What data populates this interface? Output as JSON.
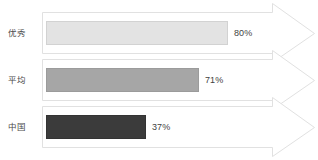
{
  "chart_data": {
    "type": "bar",
    "orientation": "horizontal",
    "title": "",
    "subtitle": "",
    "xlabel": "",
    "ylabel": "",
    "xlim": [
      0,
      100
    ],
    "grid": false,
    "legend": null,
    "units": "%",
    "categories": [
      "优秀",
      "平均",
      "中国"
    ],
    "values": [
      80,
      71,
      37
    ],
    "data_labels": [
      "80%",
      "71%",
      "37%"
    ],
    "bar_colors": [
      "#e3e3e3",
      "#a6a6a6",
      "#3b3b3b"
    ],
    "series": [
      {
        "name": "",
        "points": [
          {
            "category": "优秀",
            "value": 80,
            "label": "80%",
            "color": "#e3e3e3"
          },
          {
            "category": "平均",
            "value": 71,
            "label": "71%",
            "color": "#a6a6a6"
          },
          {
            "category": "中国",
            "value": 37,
            "label": "37%",
            "color": "#3b3b3b"
          }
        ]
      }
    ],
    "annotations": []
  },
  "rows": [
    {
      "label": "优秀",
      "value_label": "80%",
      "bar_width_px": 182,
      "bar_color": "#e3e3e3",
      "bar_border": "#d2d2d2",
      "value_left_px": 188
    },
    {
      "label": "平均",
      "value_label": "71%",
      "bar_width_px": 153,
      "bar_color": "#a6a6a6",
      "bar_border": "#9b9b9b",
      "value_left_px": 159
    },
    {
      "label": "中国",
      "value_label": "37%",
      "bar_width_px": 100,
      "bar_color": "#3b3b3b",
      "bar_border": "#333333",
      "value_left_px": 106
    }
  ],
  "style": {
    "background": "#ffffff",
    "arrow_stroke": "#e1e1e1",
    "arrow_fill": "#ffffff",
    "label_color": "#4a4a4a",
    "value_color": "#3f3f3f"
  },
  "arrow_shape": {
    "name": "right-arrow-band",
    "body_left_px": 42,
    "body_right_px": 272,
    "tip_x_px": 315,
    "notch_px": 9,
    "count": 3
  }
}
